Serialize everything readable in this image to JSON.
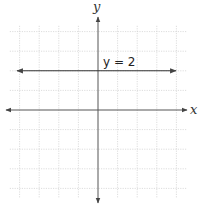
{
  "diagram": {
    "type": "coordinate-plane",
    "x_axis_label": "x",
    "y_axis_label": "y",
    "x_range": [
      -4.5,
      4.5
    ],
    "y_range": [
      -4.5,
      4.5
    ],
    "grid_step": 1,
    "line": {
      "equation_label": "y = 2",
      "kind": "horizontal",
      "y_value": 2,
      "color": "#333333"
    },
    "colors": {
      "grid": "#cfcfcf",
      "axis": "#555555"
    }
  }
}
